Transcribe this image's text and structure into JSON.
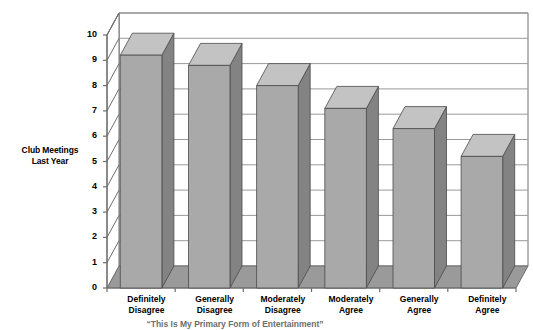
{
  "chart_data": {
    "type": "bar",
    "title": "",
    "subtitle": "",
    "categories": [
      "Definitely Disagree",
      "Generally Disagree",
      "Moderately Disagree",
      "Moderately Agree",
      "Generally Agree",
      "Definitely Agree"
    ],
    "values": [
      9.2,
      8.8,
      8.0,
      7.1,
      6.3,
      5.2
    ],
    "xlabel": "“This Is My Primary Form of Entertainment”",
    "ylabel": "Club Meetings Last Year",
    "ylim": [
      0,
      10
    ],
    "yticks": [
      0,
      1,
      2,
      3,
      4,
      5,
      6,
      7,
      8,
      9,
      10
    ],
    "ytick_labels": [
      "0",
      "1",
      "2",
      "3",
      "4",
      "5",
      "6",
      "7",
      "8",
      "9",
      "10"
    ],
    "grid": true,
    "legend": false,
    "style": "3d-column",
    "colors": {
      "bar_front": "#a9a9a9",
      "bar_side": "#838383",
      "bar_top": "#c3c3c3",
      "floor": "#9a9a9a",
      "wall": "#ffffff",
      "gridline": "#9a9a9a",
      "axis": "#6e6e6e",
      "text": "#000000",
      "caption_text": "#6e6e6e"
    }
  },
  "axis": {
    "y_title_line1": "Club Meetings",
    "y_title_line2": "Last Year"
  },
  "caption": {
    "text": "“This Is My Primary Form of Entertainment”"
  }
}
